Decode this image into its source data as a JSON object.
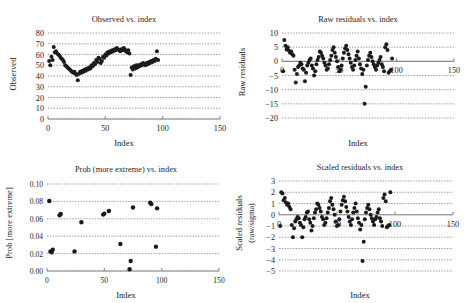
{
  "figure": {
    "background": "#ffffff",
    "point_color": "#1b1b1b",
    "grid_color": "#555555",
    "axis_color": "#8a8a8a",
    "panel_count": 4
  },
  "chart_data": [
    {
      "id": "observed-vs-index",
      "type": "scatter",
      "title": "Observed vs. index",
      "xlabel": "Index",
      "ylabel": "Observed",
      "xlim": [
        0,
        150
      ],
      "ylim": [
        0,
        80
      ],
      "xticks": [
        0,
        50,
        100,
        150
      ],
      "yticks": [
        0,
        10,
        20,
        30,
        40,
        50,
        60,
        70,
        80
      ],
      "grid": true,
      "legend": "none",
      "x": [
        1,
        2,
        3,
        4,
        5,
        6,
        7,
        8,
        9,
        10,
        11,
        12,
        13,
        14,
        15,
        16,
        17,
        18,
        19,
        20,
        21,
        22,
        23,
        24,
        25,
        26,
        27,
        28,
        29,
        30,
        31,
        32,
        33,
        34,
        35,
        36,
        37,
        38,
        39,
        40,
        41,
        42,
        43,
        44,
        45,
        46,
        47,
        48,
        49,
        50,
        51,
        52,
        53,
        54,
        55,
        56,
        57,
        58,
        59,
        60,
        61,
        62,
        63,
        64,
        65,
        66,
        67,
        68,
        69,
        70,
        71,
        72,
        73,
        74,
        75,
        76,
        77,
        78,
        79,
        80,
        81,
        82,
        83,
        84,
        85,
        86,
        87,
        88,
        89,
        90,
        91,
        92,
        93,
        94,
        95,
        96
      ],
      "y": [
        54,
        50,
        58,
        55,
        67,
        62,
        63,
        61,
        60,
        59,
        57,
        56,
        55,
        53,
        50,
        49,
        48,
        47,
        46,
        45,
        44,
        43,
        44,
        42,
        41,
        36,
        42,
        44,
        43,
        45,
        44,
        46,
        45,
        47,
        46,
        48,
        47,
        50,
        49,
        52,
        51,
        55,
        53,
        57,
        56,
        52,
        54,
        58,
        57,
        60,
        59,
        62,
        61,
        63,
        62,
        64,
        63,
        65,
        64,
        66,
        65,
        64,
        63,
        65,
        64,
        66,
        65,
        63,
        62,
        64,
        61,
        41,
        48,
        46,
        49,
        47,
        50,
        48,
        50,
        49,
        51,
        50,
        52,
        51,
        50,
        52,
        51,
        53,
        52,
        54,
        53,
        55,
        54,
        56,
        63,
        55
      ]
    },
    {
      "id": "raw-residuals-vs-index",
      "type": "scatter",
      "title": "Raw residuals vs. index",
      "xlabel": "Index",
      "ylabel": "Raw residuals",
      "xlim": [
        0,
        150
      ],
      "ylim": [
        -20,
        10
      ],
      "xticks": [
        0,
        50,
        100,
        150
      ],
      "yticks": [
        -20,
        -15,
        -10,
        -5,
        0,
        5,
        10
      ],
      "grid": true,
      "legend": "none",
      "x": [
        1,
        2,
        3,
        4,
        5,
        6,
        7,
        8,
        9,
        10,
        11,
        12,
        13,
        14,
        15,
        16,
        17,
        18,
        19,
        20,
        21,
        22,
        23,
        24,
        25,
        26,
        27,
        28,
        29,
        30,
        31,
        32,
        33,
        34,
        35,
        36,
        37,
        38,
        39,
        40,
        41,
        42,
        43,
        44,
        45,
        46,
        47,
        48,
        49,
        50,
        51,
        52,
        53,
        54,
        55,
        56,
        57,
        58,
        59,
        60,
        61,
        62,
        63,
        64,
        65,
        66,
        67,
        68,
        69,
        70,
        71,
        72,
        73,
        74,
        75,
        76,
        77,
        78,
        79,
        80,
        81,
        82,
        83,
        84,
        85,
        86,
        87,
        88,
        89,
        90,
        91,
        92,
        93,
        94,
        95,
        96
      ],
      "y": [
        -3.5,
        7.5,
        5.5,
        4.2,
        5.0,
        3.8,
        3.0,
        3.5,
        2.5,
        2.0,
        -3.0,
        -7.5,
        -4.5,
        -2.0,
        -1.5,
        -0.5,
        -1.0,
        -2.5,
        -3.0,
        -7.0,
        -4.0,
        -1.5,
        -0.5,
        0.5,
        1.0,
        -1.5,
        -2.5,
        -5.0,
        -3.5,
        -1.0,
        0.5,
        1.5,
        3.5,
        3.0,
        2.0,
        1.0,
        -0.5,
        -1.5,
        -3.0,
        -2.5,
        -1.0,
        0.5,
        2.0,
        4.0,
        5.0,
        3.0,
        1.5,
        0.0,
        -2.0,
        -3.5,
        -3.0,
        -1.5,
        1.0,
        3.0,
        4.5,
        5.5,
        4.0,
        2.5,
        1.0,
        -0.5,
        -2.0,
        -3.0,
        -1.5,
        0.5,
        2.0,
        3.5,
        1.0,
        -1.0,
        -2.5,
        -4.5,
        -3.0,
        -15.0,
        -9.0,
        -1.5,
        0.5,
        2.0,
        3.0,
        1.5,
        0.0,
        -1.0,
        -2.0,
        -3.0,
        -1.5,
        -0.5,
        0.5,
        1.5,
        -1.0,
        -2.0,
        -3.5,
        5.0,
        6.0,
        4.0,
        -4.0,
        -3.5,
        -3.0,
        1.0
      ]
    },
    {
      "id": "prob-more-extreme-vs-index",
      "type": "scatter",
      "title": "Prob (more extreme) vs. index",
      "xlabel": "Index",
      "ylabel": "Prob [more extreme]",
      "xlim": [
        0,
        150
      ],
      "ylim": [
        0.0,
        0.1
      ],
      "xticks": [
        0,
        50,
        100,
        150
      ],
      "yticks": [
        "0.00",
        "0.02",
        "0.04",
        "0.06",
        "0.08",
        "0.10"
      ],
      "grid": true,
      "legend": "none",
      "x": [
        2,
        3,
        4,
        5,
        11,
        12,
        24,
        30,
        49,
        50,
        54,
        64,
        72,
        73,
        75,
        90,
        91,
        95,
        96
      ],
      "y": [
        0.0805,
        0.0225,
        0.0215,
        0.0245,
        0.064,
        0.0655,
        0.0225,
        0.056,
        0.0648,
        0.066,
        0.069,
        0.031,
        0.002,
        0.0115,
        0.073,
        0.0785,
        0.077,
        0.028,
        0.072
      ]
    },
    {
      "id": "scaled-residuals-vs-index",
      "type": "scatter",
      "title": "Scaled residuals vs. index",
      "xlabel": "Index",
      "ylabel": "Scaled residuals (raw/sigma)",
      "ylabel_line1": "Scaled residuals",
      "ylabel_line2": "(raw/sigma)",
      "xlim": [
        0,
        150
      ],
      "ylim": [
        -5,
        3
      ],
      "xticks": [
        0,
        50,
        100,
        150
      ],
      "yticks": [
        -5,
        -4,
        -3,
        -2,
        -1,
        0,
        1,
        2,
        3
      ],
      "grid": true,
      "legend": "none",
      "x": [
        1,
        2,
        3,
        4,
        5,
        6,
        7,
        8,
        9,
        10,
        11,
        12,
        13,
        14,
        15,
        16,
        17,
        18,
        19,
        20,
        21,
        22,
        23,
        24,
        25,
        26,
        27,
        28,
        29,
        30,
        31,
        32,
        33,
        34,
        35,
        36,
        37,
        38,
        39,
        40,
        41,
        42,
        43,
        44,
        45,
        46,
        47,
        48,
        49,
        50,
        51,
        52,
        53,
        54,
        55,
        56,
        57,
        58,
        59,
        60,
        61,
        62,
        63,
        64,
        65,
        66,
        67,
        68,
        69,
        70,
        71,
        72,
        73,
        74,
        75,
        76,
        77,
        78,
        79,
        80,
        81,
        82,
        83,
        84,
        85,
        86,
        87,
        88,
        89,
        90,
        91,
        92,
        93,
        94,
        95,
        96
      ],
      "y": [
        -1.0,
        2.0,
        1.9,
        1.3,
        1.5,
        1.1,
        0.9,
        1.0,
        0.7,
        0.5,
        -0.9,
        -2.0,
        -1.2,
        -0.6,
        -0.4,
        -0.2,
        -0.3,
        -0.7,
        -0.9,
        -2.0,
        -1.1,
        -0.4,
        -0.2,
        0.2,
        0.3,
        -0.4,
        -0.7,
        -1.4,
        -1.0,
        -0.3,
        0.2,
        0.5,
        1.0,
        0.9,
        0.6,
        0.3,
        -0.2,
        -0.4,
        -0.9,
        -0.7,
        -0.3,
        0.2,
        0.6,
        1.2,
        1.5,
        0.9,
        0.5,
        0.0,
        -0.6,
        -1.0,
        -0.9,
        -0.4,
        0.3,
        0.9,
        1.3,
        1.6,
        1.2,
        0.7,
        0.3,
        -0.2,
        -0.6,
        -0.9,
        -0.4,
        0.2,
        0.6,
        1.0,
        0.3,
        -0.3,
        -0.7,
        -1.3,
        -0.9,
        -4.1,
        -2.4,
        -0.4,
        0.2,
        0.6,
        0.9,
        0.5,
        0.0,
        -0.3,
        -0.6,
        -0.9,
        -0.4,
        -0.2,
        0.2,
        0.5,
        -0.3,
        -0.6,
        -1.0,
        1.5,
        1.8,
        1.2,
        -1.1,
        -1.0,
        -0.9,
        2.0
      ]
    }
  ]
}
